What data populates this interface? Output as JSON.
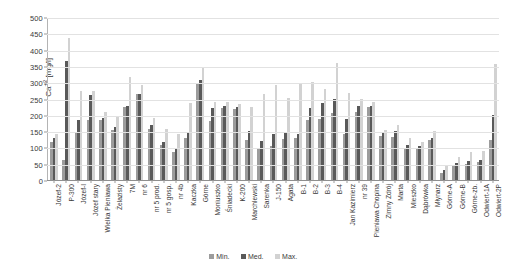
{
  "chart_data": {
    "type": "bar",
    "title": "",
    "xlabel": "",
    "ylabel": "Ca+2 [mg/l]",
    "ylim": [
      0,
      500
    ],
    "yticks": [
      0,
      50,
      100,
      150,
      200,
      250,
      300,
      350,
      400,
      450,
      500
    ],
    "grid": true,
    "legend_position": "bottom",
    "legend": [
      "Min.",
      "Med.",
      "Max."
    ],
    "categories": [
      "Józef-2",
      "P-300",
      "Józef-I",
      "Józef stary",
      "Wielka Pieniawa",
      "Żelazisty",
      "7M",
      "nr 6",
      "nr 5 prod.",
      "nr 5 gosp.",
      "nr 4b",
      "Kaczka",
      "Górne",
      "Moniuszko",
      "Śniadecki",
      "K-200",
      "Marchlewski",
      "Sarenka",
      "J-150",
      "Agata",
      "B-1",
      "B-2",
      "B-3",
      "B-4",
      "Jan Kazimierz",
      "nr 39",
      "Pieniawa Chopina",
      "Zimny Zdrój",
      "Marta",
      "Mieszko",
      "Dąbrówka",
      "Młynarz",
      "Górne-A",
      "Górne-B",
      "Górne-zb.",
      "Odwiert-1A",
      "Odwiert-2P"
    ],
    "series": [
      {
        "name": "Min.",
        "color": "#9c9c9c",
        "values": [
          118,
          60,
          148,
          183,
          184,
          153,
          225,
          263,
          155,
          108,
          85,
          130,
          296,
          182,
          220,
          218,
          124,
          95,
          105,
          125,
          130,
          183,
          186,
          205,
          140,
          208,
          225,
          136,
          133,
          97,
          96,
          122,
          22,
          45,
          48,
          55,
          124
        ]
      },
      {
        "name": "Med.",
        "color": "#595959",
        "values": [
          128,
          366,
          183,
          262,
          190,
          163,
          228,
          265,
          168,
          118,
          95,
          145,
          308,
          222,
          228,
          225,
          150,
          120,
          142,
          148,
          140,
          222,
          236,
          248,
          186,
          228,
          228,
          145,
          150,
          108,
          105,
          130,
          30,
          52,
          57,
          62,
          200
        ]
      },
      {
        "name": "Max.",
        "color": "#d2d2d2",
        "values": [
          140,
          437,
          272,
          272,
          208,
          192,
          317,
          292,
          190,
          158,
          140,
          235,
          345,
          238,
          240,
          232,
          225,
          265,
          290,
          252,
          296,
          300,
          278,
          358,
          268,
          248,
          240,
          152,
          168,
          128,
          118,
          150,
          45,
          72,
          85,
          90,
          355
        ]
      }
    ]
  }
}
